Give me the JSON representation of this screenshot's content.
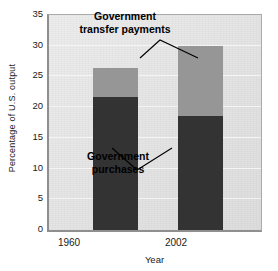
{
  "chart_data": {
    "type": "bar",
    "subtype": "stacked-bar",
    "title": "",
    "xlabel": "Year",
    "ylabel": "Percentage of U.S. output",
    "categories": [
      "1960",
      "2002"
    ],
    "ylim": [
      0,
      35
    ],
    "ytick_labels": [
      "0",
      "5",
      "10",
      "15",
      "20",
      "25",
      "30",
      "35"
    ],
    "ytick_values": [
      0,
      5,
      10,
      15,
      20,
      25,
      30,
      35
    ],
    "grid": true,
    "grid_axis": "y",
    "legend": "none",
    "series": [
      {
        "name": "Government purchases",
        "color": "#333333",
        "values": [
          21.7,
          18.5
        ]
      },
      {
        "name": "Government transfer payments",
        "color": "#969696",
        "values": [
          4.6,
          11.5
        ]
      }
    ],
    "totals": [
      26.3,
      30.0
    ],
    "annotations": [
      {
        "id": "transfers",
        "text_line1": "Government",
        "text_line2": "transfer payments",
        "target_series": "Government transfer payments"
      },
      {
        "id": "purchases",
        "text_line1": "Government",
        "text_line2": "purchases",
        "target_series": "Government purchases"
      }
    ]
  },
  "colors": {
    "purchases": "#333333",
    "transfers": "#969696",
    "plot_background": "#e3e3e3",
    "gridline": "#f4f4f4",
    "axis": "#8f8f8f"
  }
}
